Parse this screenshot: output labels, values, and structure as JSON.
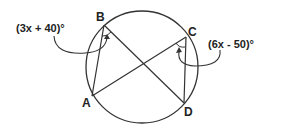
{
  "diagram": {
    "type": "circle-inscribed-angles",
    "points": {
      "A": {
        "label": "A",
        "x": 92,
        "y": 96
      },
      "B": {
        "label": "B",
        "x": 104,
        "y": 25
      },
      "C": {
        "label": "C",
        "x": 186,
        "y": 37
      },
      "D": {
        "label": "D",
        "x": 184,
        "y": 103
      }
    },
    "circle": {
      "cx": 142,
      "cy": 67,
      "r": 56
    },
    "segments": [
      "AB",
      "BD",
      "AC",
      "CD"
    ],
    "angle_labels": {
      "B": "(3x + 40)°",
      "C": "(6x - 50)°"
    },
    "colors": {
      "stroke": "#333333",
      "text": "#222222"
    }
  }
}
